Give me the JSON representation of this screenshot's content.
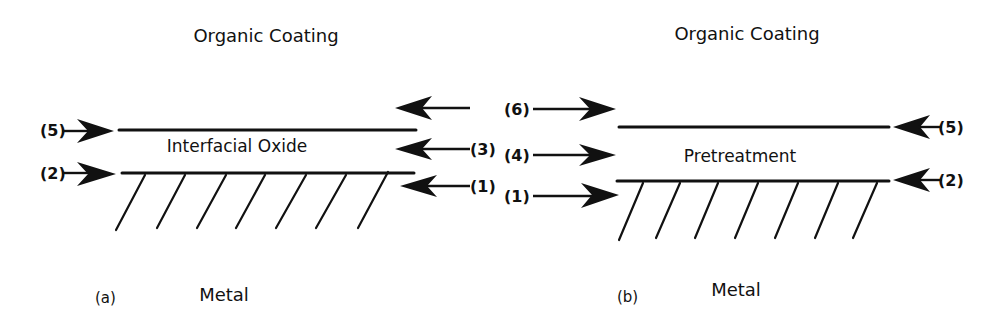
{
  "panels": [
    {
      "id": "a",
      "caption": "(a)",
      "top_label": "Organic Coating",
      "middle_label": "Interfacial Oxide",
      "bottom_label": "Metal",
      "arrows": [
        {
          "label": "(5)",
          "side": "left",
          "target": "coating/oxide interface"
        },
        {
          "label": "(2)",
          "side": "left",
          "target": "oxide/metal interface"
        },
        {
          "label": "",
          "side": "right",
          "target": "organic coating"
        },
        {
          "label": "(3)",
          "side": "right",
          "target": "interfacial oxide"
        },
        {
          "label": "(1)",
          "side": "right",
          "target": "metal"
        }
      ]
    },
    {
      "id": "b",
      "caption": "(b)",
      "top_label": "Organic Coating",
      "middle_label": "Pretreatment",
      "bottom_label": "Metal",
      "arrows": [
        {
          "label": "(6)",
          "side": "left",
          "target": "organic coating"
        },
        {
          "label": "(4)",
          "side": "left",
          "target": "pretreatment"
        },
        {
          "label": "(1)",
          "side": "left",
          "target": "metal"
        },
        {
          "label": "(5)",
          "side": "right",
          "target": "coating/pretreatment interface"
        },
        {
          "label": "(2)",
          "side": "right",
          "target": "pretreatment/metal interface"
        }
      ]
    }
  ],
  "colors": {
    "ink": "#111111",
    "background": "#ffffff"
  }
}
